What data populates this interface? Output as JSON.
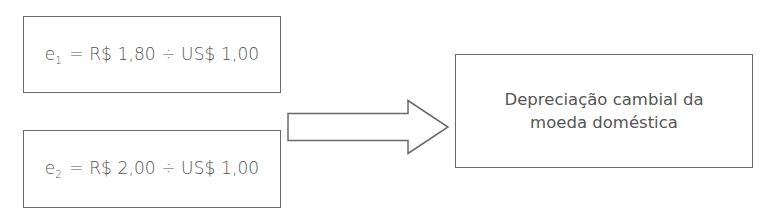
{
  "diagram": {
    "type": "flow",
    "inputs": [
      {
        "var": "e",
        "subscript": "1",
        "expression": "= R$ 1,80 ÷ US$ 1,00"
      },
      {
        "var": "e",
        "subscript": "2",
        "expression": "= R$ 2,00 ÷ US$ 1,00"
      }
    ],
    "arrow": {
      "icon": "right-block-arrow-icon",
      "direction": "right"
    },
    "output": {
      "line1": "Depreciação cambial da",
      "line2": "moeda doméstica"
    },
    "colors": {
      "stroke": "#6a6a6a",
      "text": "#555555",
      "background": "#ffffff"
    }
  }
}
